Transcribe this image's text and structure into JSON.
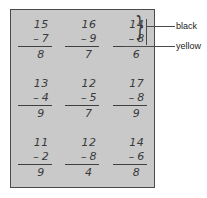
{
  "worksheet": {
    "name": "subtraction-worksheet",
    "background_color": "#c9c9c9",
    "border_color": "#4a4a4a",
    "problems": [
      {
        "minuend": "15",
        "operator": "–",
        "subtrahend": "7",
        "answer": "8"
      },
      {
        "minuend": "16",
        "operator": "–",
        "subtrahend": "9",
        "answer": "7"
      },
      {
        "minuend": "14",
        "operator": "–",
        "subtrahend": "8",
        "answer": "6"
      },
      {
        "minuend": "13",
        "operator": "–",
        "subtrahend": "4",
        "answer": "9"
      },
      {
        "minuend": "12",
        "operator": "–",
        "subtrahend": "5",
        "answer": "7"
      },
      {
        "minuend": "17",
        "operator": "–",
        "subtrahend": "8",
        "answer": "9"
      },
      {
        "minuend": "11",
        "operator": "–",
        "subtrahend": "2",
        "answer": "9"
      },
      {
        "minuend": "12",
        "operator": "–",
        "subtrahend": "8",
        "answer": "4"
      },
      {
        "minuend": "14",
        "operator": "–",
        "subtrahend": "6",
        "answer": "8"
      }
    ]
  },
  "annotations": {
    "brace_glyph": "}",
    "callouts": [
      {
        "label": "black",
        "target": "problem-digits"
      },
      {
        "label": "yellow",
        "target": "problem-answer"
      }
    ]
  }
}
